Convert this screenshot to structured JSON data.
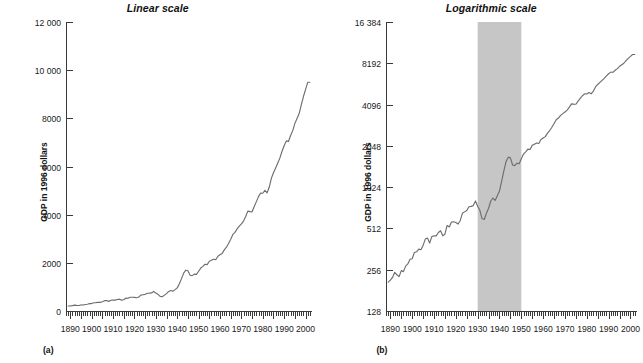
{
  "figure": {
    "panels": [
      {
        "letter": "(a)",
        "title": "Linear scale",
        "ylabel": "GDP in 1996 dollars",
        "scale": "linear"
      },
      {
        "letter": "(b)",
        "title": "Logarithmic scale",
        "ylabel": "GDP in 1996 dollars",
        "scale": "log2"
      }
    ],
    "line_color": "#6e6e6e",
    "axis_color": "#3a3a3a",
    "shade_color": "#c6c6c6"
  },
  "chart_data": [
    {
      "type": "line",
      "title": "Linear scale",
      "panel_letter": "(a)",
      "xlabel": "",
      "ylabel": "GDP in 1996 dollars",
      "xlim": [
        1888,
        2003
      ],
      "ylim": [
        0,
        12000
      ],
      "yscale": "linear",
      "grid": false,
      "legend": "none",
      "ytick_labels": [
        "12 000",
        "10 000",
        "8000",
        "6000",
        "4000",
        "2000",
        "0"
      ],
      "ytick_values": [
        12000,
        10000,
        8000,
        6000,
        4000,
        2000,
        0
      ],
      "xtick_labels": [
        "1890",
        "1900",
        "1910",
        "1920",
        "1930",
        "1940",
        "1950",
        "1960",
        "1970",
        "1980",
        "1990",
        "2000"
      ],
      "xtick_values": [
        1890,
        1900,
        1910,
        1920,
        1930,
        1940,
        1950,
        1960,
        1970,
        1980,
        1990,
        2000
      ],
      "minor_ticks": "every year; taller tick every 5 years",
      "x": [
        1889,
        1890,
        1891,
        1892,
        1893,
        1894,
        1895,
        1896,
        1897,
        1898,
        1899,
        1900,
        1901,
        1902,
        1903,
        1904,
        1905,
        1906,
        1907,
        1908,
        1909,
        1910,
        1911,
        1912,
        1913,
        1914,
        1915,
        1916,
        1917,
        1918,
        1919,
        1920,
        1921,
        1922,
        1923,
        1924,
        1925,
        1926,
        1927,
        1928,
        1929,
        1930,
        1931,
        1932,
        1933,
        1934,
        1935,
        1936,
        1937,
        1938,
        1939,
        1940,
        1941,
        1942,
        1943,
        1944,
        1945,
        1946,
        1947,
        1948,
        1949,
        1950,
        1951,
        1952,
        1953,
        1954,
        1955,
        1956,
        1957,
        1958,
        1959,
        1960,
        1961,
        1962,
        1963,
        1964,
        1965,
        1966,
        1967,
        1968,
        1969,
        1970,
        1971,
        1972,
        1973,
        1974,
        1975,
        1976,
        1977,
        1978,
        1979,
        1980,
        1981,
        1982,
        1983,
        1984,
        1985,
        1986,
        1987,
        1988,
        1989,
        1990,
        1991,
        1992,
        1993,
        1994,
        1995,
        1996,
        1997,
        1998,
        1999,
        2000,
        2001,
        2002
      ],
      "y": [
        208,
        215,
        225,
        245,
        235,
        228,
        252,
        248,
        272,
        282,
        305,
        308,
        342,
        346,
        362,
        358,
        385,
        428,
        436,
        400,
        447,
        452,
        452,
        478,
        492,
        452,
        466,
        538,
        525,
        570,
        573,
        565,
        551,
        583,
        660,
        676,
        692,
        736,
        742,
        751,
        812,
        742,
        694,
        604,
        595,
        660,
        718,
        811,
        853,
        820,
        886,
        961,
        1131,
        1344,
        1570,
        1694,
        1673,
        1485,
        1470,
        1531,
        1519,
        1651,
        1783,
        1853,
        1940,
        1928,
        2065,
        2108,
        2150,
        2131,
        2276,
        2334,
        2391,
        2538,
        2649,
        2802,
        2983,
        3179,
        3265,
        3414,
        3520,
        3619,
        3735,
        3927,
        4148,
        4127,
        4118,
        4342,
        4541,
        4749,
        4899,
        4889,
        5013,
        4909,
        5135,
        5510,
        5740,
        5940,
        6143,
        6357,
        6631,
        6874,
        7063,
        7041,
        7286,
        7489,
        7791,
        7995,
        8197,
        8558,
        8905,
        9200,
        9496,
        9498,
        9618
      ],
      "units": "billions of 1996 dollars"
    },
    {
      "type": "line",
      "title": "Logarithmic scale",
      "panel_letter": "(b)",
      "xlabel": "",
      "ylabel": "GDP in 1996 dollars",
      "xlim": [
        1888,
        2003
      ],
      "ylim": [
        128,
        16384
      ],
      "yscale": "log2",
      "grid": false,
      "legend": "none",
      "ytick_labels": [
        "16 384",
        "8192",
        "4096",
        "2048",
        "1024",
        "512",
        "256",
        "128"
      ],
      "ytick_values": [
        16384,
        8192,
        4096,
        2048,
        1024,
        512,
        256,
        128
      ],
      "xtick_labels": [
        "1890",
        "1900",
        "1910",
        "1920",
        "1930",
        "1940",
        "1950",
        "1960",
        "1970",
        "1980",
        "1990",
        "2000"
      ],
      "xtick_values": [
        1890,
        1900,
        1910,
        1920,
        1930,
        1940,
        1950,
        1960,
        1970,
        1980,
        1990,
        2000
      ],
      "minor_ticks": "every year; taller tick every 5 years",
      "shaded_region": {
        "from": 1930,
        "to": 1950,
        "color": "#c6c6c6"
      },
      "x": [
        1889,
        1890,
        1891,
        1892,
        1893,
        1894,
        1895,
        1896,
        1897,
        1898,
        1899,
        1900,
        1901,
        1902,
        1903,
        1904,
        1905,
        1906,
        1907,
        1908,
        1909,
        1910,
        1911,
        1912,
        1913,
        1914,
        1915,
        1916,
        1917,
        1918,
        1919,
        1920,
        1921,
        1922,
        1923,
        1924,
        1925,
        1926,
        1927,
        1928,
        1929,
        1930,
        1931,
        1932,
        1933,
        1934,
        1935,
        1936,
        1937,
        1938,
        1939,
        1940,
        1941,
        1942,
        1943,
        1944,
        1945,
        1946,
        1947,
        1948,
        1949,
        1950,
        1951,
        1952,
        1953,
        1954,
        1955,
        1956,
        1957,
        1958,
        1959,
        1960,
        1961,
        1962,
        1963,
        1964,
        1965,
        1966,
        1967,
        1968,
        1969,
        1970,
        1971,
        1972,
        1973,
        1974,
        1975,
        1976,
        1977,
        1978,
        1979,
        1980,
        1981,
        1982,
        1983,
        1984,
        1985,
        1986,
        1987,
        1988,
        1989,
        1990,
        1991,
        1992,
        1993,
        1994,
        1995,
        1996,
        1997,
        1998,
        1999,
        2000,
        2001,
        2002
      ],
      "y": [
        208,
        215,
        225,
        245,
        235,
        228,
        252,
        248,
        272,
        282,
        305,
        308,
        342,
        346,
        362,
        358,
        385,
        428,
        436,
        400,
        447,
        452,
        452,
        478,
        492,
        452,
        466,
        538,
        525,
        570,
        573,
        565,
        551,
        583,
        660,
        676,
        692,
        736,
        742,
        751,
        812,
        742,
        694,
        604,
        595,
        660,
        718,
        811,
        853,
        820,
        886,
        961,
        1131,
        1344,
        1570,
        1694,
        1673,
        1485,
        1470,
        1531,
        1519,
        1651,
        1783,
        1853,
        1940,
        1928,
        2065,
        2108,
        2150,
        2131,
        2276,
        2334,
        2391,
        2538,
        2649,
        2802,
        2983,
        3179,
        3265,
        3414,
        3520,
        3619,
        3735,
        3927,
        4148,
        4127,
        4118,
        4342,
        4541,
        4749,
        4899,
        4889,
        5013,
        4909,
        5135,
        5510,
        5740,
        5940,
        6143,
        6357,
        6631,
        6874,
        7063,
        7041,
        7286,
        7489,
        7791,
        7995,
        8197,
        8558,
        8905,
        9200,
        9496,
        9498,
        9618
      ],
      "units": "billions of 1996 dollars"
    }
  ]
}
